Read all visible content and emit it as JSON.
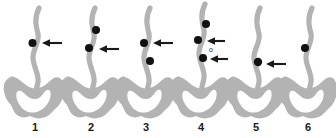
{
  "figure": {
    "title": "",
    "background_color": "#ffffff",
    "anatomy_color": "#b3b3b3",
    "stone_color": "#111111",
    "arrow_color": "#1a1a1a",
    "label_color": "#1a1a1a",
    "panel_count": 6
  },
  "panels": [
    {
      "number": "1",
      "label_x": 35,
      "label_y": 131,
      "ureter_x": 35,
      "stones": [
        {
          "cx": 32.5,
          "cy": 43,
          "r": 4.0
        }
      ],
      "arrows": [
        {
          "tip_x": 42,
          "tip_y": 43,
          "tail_x": 62,
          "tail_y": 43
        }
      ],
      "markers": []
    },
    {
      "number": "2",
      "label_x": 91,
      "label_y": 131,
      "ureter_x": 91,
      "stones": [
        {
          "cx": 96,
          "cy": 30,
          "r": 4.0
        },
        {
          "cx": 89,
          "cy": 48,
          "r": 4.0
        }
      ],
      "arrows": [
        {
          "tip_x": 99,
          "tip_y": 49,
          "tail_x": 119,
          "tail_y": 49
        }
      ],
      "markers": []
    },
    {
      "number": "3",
      "label_x": 146,
      "label_y": 131,
      "ureter_x": 146,
      "stones": [
        {
          "cx": 144,
          "cy": 43,
          "r": 4.0
        },
        {
          "cx": 150,
          "cy": 61,
          "r": 4.0
        }
      ],
      "arrows": [
        {
          "tip_x": 153,
          "tip_y": 43,
          "tail_x": 173,
          "tail_y": 43
        }
      ],
      "markers": []
    },
    {
      "number": "4",
      "label_x": 201,
      "label_y": 131,
      "ureter_x": 201,
      "stones": [
        {
          "cx": 206,
          "cy": 24,
          "r": 4.0
        },
        {
          "cx": 198,
          "cy": 40,
          "r": 4.0
        },
        {
          "cx": 203,
          "cy": 58,
          "r": 4.0
        }
      ],
      "arrows": [
        {
          "tip_x": 207,
          "tip_y": 41,
          "tail_x": 225,
          "tail_y": 41
        },
        {
          "tip_x": 210,
          "tip_y": 59,
          "tail_x": 228,
          "tail_y": 59
        }
      ],
      "markers": [
        {
          "text": "o",
          "x": 211,
          "y": 52
        }
      ]
    },
    {
      "number": "5",
      "label_x": 256,
      "label_y": 131,
      "ureter_x": 256,
      "stones": [
        {
          "cx": 258,
          "cy": 62,
          "r": 4.2
        }
      ],
      "arrows": [
        {
          "tip_x": 266,
          "tip_y": 64,
          "tail_x": 286,
          "tail_y": 64
        }
      ],
      "markers": []
    },
    {
      "number": "6",
      "label_x": 308,
      "label_y": 131,
      "ureter_x": 308,
      "stones": [
        {
          "cx": 305,
          "cy": 48,
          "r": 4.0
        }
      ],
      "arrows": [],
      "markers": []
    }
  ]
}
